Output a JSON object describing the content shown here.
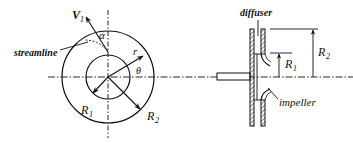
{
  "figure": {
    "left_view": {
      "labels": {
        "velocity": "V",
        "velocity_sub": "1",
        "angle_alpha": "α",
        "streamline": "streamline",
        "radius_r": "r",
        "angle_theta": "θ",
        "inner_radius": "R",
        "inner_radius_sub": "1",
        "outer_radius": "R",
        "outer_radius_sub": "2"
      }
    },
    "right_view": {
      "labels": {
        "diffuser": "diffuser",
        "impeller": "impeller",
        "inner_radius": "R",
        "inner_radius_sub": "1",
        "outer_radius": "R",
        "outer_radius_sub": "2"
      }
    },
    "colors": {
      "ink": "#111111",
      "background": "#ffffff"
    }
  }
}
